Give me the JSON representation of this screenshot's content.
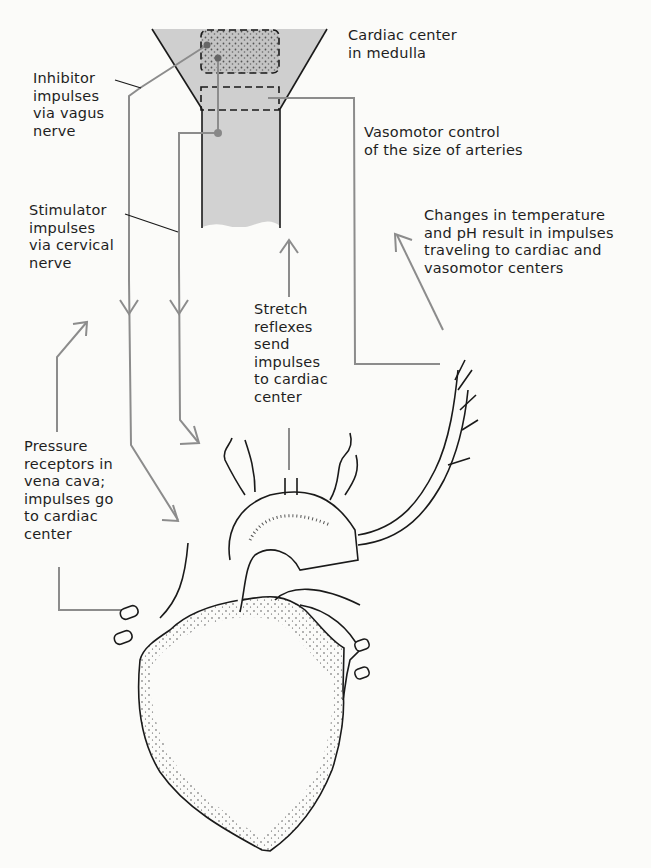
{
  "figure": {
    "colors": {
      "background": "#fbfbf9",
      "spinal_cord_fill": "#cfcfcf",
      "cardiac_center_fill": "#bdbdbd",
      "nerve_line": "#8c8c8c",
      "outline": "#1a1a1a",
      "text": "#1e1e1e"
    }
  },
  "labels": {
    "cardiac_center": "Cardiac center\nin medulla",
    "inhibitor": "Inhibitor\nimpulses\nvia vagus\nnerve",
    "vasomotor": "Vasomotor control\nof the size of arteries",
    "stimulator": "Stimulator\nimpulses\nvia cervical\nnerve",
    "temperature": "Changes in temperature\nand pH result in impulses\ntraveling to cardiac and\nvasomotor centers",
    "stretch": "Stretch\nreflexes\nsend\nimpulses\nto cardiac\ncenter",
    "pressure": "Pressure\nreceptors in\nvena cava;\nimpulses go\nto cardiac\ncenter"
  },
  "structures": [
    "medulla",
    "cardiac-center",
    "vasomotor-center",
    "spinal-cord",
    "vagus-nerve",
    "cervical-nerve",
    "heart",
    "aortic-arch",
    "vena-cava",
    "pulmonary-veins",
    "carotid-artery-branches"
  ]
}
